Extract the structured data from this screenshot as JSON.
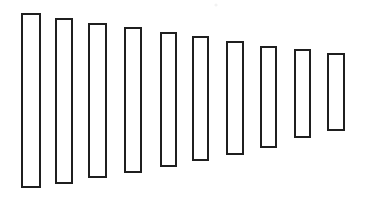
{
  "figure": {
    "title": "",
    "subtitle": "",
    "background_color": "#ffffff",
    "width": 372,
    "height": 200,
    "stroke_color": "#1f1f1f",
    "fill_color": "#ffffff",
    "stroke_width": 2,
    "marks": [
      {
        "name": "faint-speck",
        "x": 216,
        "y": 5,
        "r": 1.6,
        "color": "#f2f2f2"
      }
    ]
  },
  "chart_data": {
    "type": "bar",
    "title": "",
    "subtitle": "",
    "xlabel": "",
    "ylabel": "",
    "xlim": [
      0,
      372
    ],
    "ylim": [
      0,
      200
    ],
    "grid": false,
    "legend": null,
    "legend_position": "none",
    "axis_visible": false,
    "tick_labels_x": [],
    "tick_labels_y": [],
    "annotations": [],
    "orientation": "vertical",
    "alignment": "center-tapering",
    "note": "Ten hollow outlined rectangles of decreasing height, shrinking from both top and bottom, arranged left to right.",
    "categories": [
      "1",
      "2",
      "3",
      "4",
      "5",
      "6",
      "7",
      "8",
      "9",
      "10"
    ],
    "values": [
      175,
      166,
      155,
      146,
      135,
      125,
      114,
      102,
      89,
      78
    ],
    "widths": [
      20,
      18,
      19,
      18,
      17,
      17,
      18,
      17,
      17,
      18
    ],
    "bars": [
      {
        "label": "1",
        "x": 21,
        "y": 13,
        "width": 20,
        "height": 175
      },
      {
        "label": "2",
        "x": 55,
        "y": 18,
        "width": 18,
        "height": 166
      },
      {
        "label": "3",
        "x": 88,
        "y": 23,
        "width": 19,
        "height": 155
      },
      {
        "label": "4",
        "x": 124,
        "y": 27,
        "width": 18,
        "height": 146
      },
      {
        "label": "5",
        "x": 160,
        "y": 32,
        "width": 17,
        "height": 135
      },
      {
        "label": "6",
        "x": 192,
        "y": 36,
        "width": 17,
        "height": 125
      },
      {
        "label": "7",
        "x": 226,
        "y": 41,
        "width": 18,
        "height": 114
      },
      {
        "label": "8",
        "x": 260,
        "y": 46,
        "width": 17,
        "height": 102
      },
      {
        "label": "9",
        "x": 294,
        "y": 49,
        "width": 17,
        "height": 89
      },
      {
        "label": "10",
        "x": 327,
        "y": 53,
        "width": 18,
        "height": 78
      }
    ]
  }
}
